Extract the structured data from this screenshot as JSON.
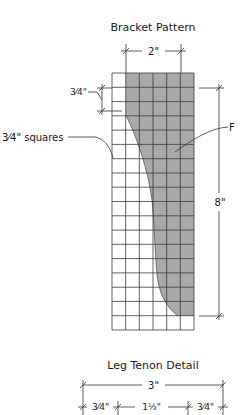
{
  "bracket": {
    "title": "Bracket Pattern",
    "width_dim": "2\"",
    "square_dim": "3⁄4\"",
    "squares_label": "3⁄4\" squares",
    "height_dim": "8\"",
    "shading_label": "F",
    "grid": {
      "columns": 6,
      "rows": 18
    },
    "colors": {
      "shade": "#a9a9a9",
      "grid_line": "#3a3a3a",
      "dim_line": "#333333"
    }
  },
  "tenon": {
    "title": "Leg Tenon Detail",
    "overall_dim": "3\"",
    "segments": [
      "3⁄4\"",
      "1½\"",
      "3⁄4\""
    ]
  }
}
